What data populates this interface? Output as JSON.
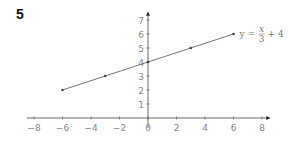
{
  "question_number": "5",
  "chart_data": {
    "type": "line",
    "title": "",
    "xlabel": "",
    "ylabel": "",
    "xlim": [
      -8,
      8
    ],
    "ylim": [
      0,
      7
    ],
    "x_ticks": [
      -8,
      -6,
      -4,
      -2,
      0,
      2,
      4,
      6,
      8
    ],
    "y_ticks": [
      1,
      2,
      3,
      4,
      5,
      6,
      7
    ],
    "grid": false,
    "series": [
      {
        "name": "y = x/3 + 4",
        "x": [
          -6,
          -3,
          0,
          3,
          6
        ],
        "y": [
          2,
          3,
          4,
          5,
          6
        ]
      }
    ],
    "annotations": [
      {
        "text": "y = x/3 + 4",
        "x": 6,
        "y": 6,
        "position": "right of line end"
      }
    ]
  },
  "labels": {
    "eq_y": "y =",
    "eq_num": "x",
    "eq_den": "3",
    "eq_tail": "+ 4"
  },
  "colors": {
    "axis": "#444444",
    "line": "#666666",
    "tick_text": "#888888"
  }
}
